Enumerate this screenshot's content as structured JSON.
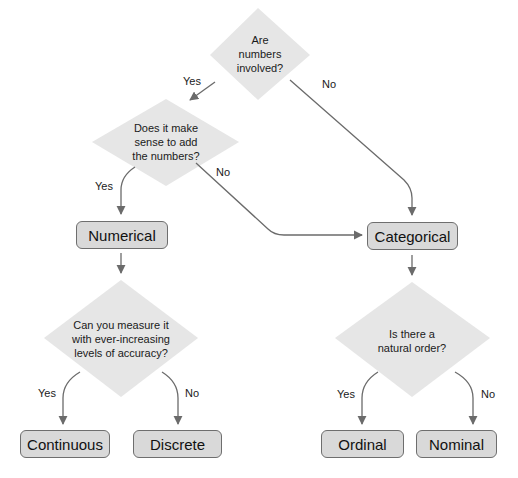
{
  "diagram": {
    "type": "decision-flowchart",
    "colors": {
      "diamond_fill": "#e6e6e6",
      "box_fill": "#d9d9d9",
      "box_border": "#6e6e6e",
      "connector": "#6b6b6b",
      "text": "#1a1a1a"
    },
    "decisions": [
      {
        "id": "d1",
        "lines": [
          "Are",
          "numbers",
          "involved?"
        ]
      },
      {
        "id": "d2",
        "lines": [
          "Does it make",
          "sense to add",
          "the numbers?"
        ]
      },
      {
        "id": "d3",
        "lines": [
          "Can you measure it",
          "with ever-increasing",
          "levels of accuracy?"
        ]
      },
      {
        "id": "d4",
        "lines": [
          "Is there a",
          "natural order?"
        ]
      }
    ],
    "outcomes": [
      {
        "id": "numerical",
        "label": "Numerical"
      },
      {
        "id": "categorical",
        "label": "Categorical"
      },
      {
        "id": "continuous",
        "label": "Continuous"
      },
      {
        "id": "discrete",
        "label": "Discrete"
      },
      {
        "id": "ordinal",
        "label": "Ordinal"
      },
      {
        "id": "nominal",
        "label": "Nominal"
      }
    ],
    "edges": [
      {
        "from": "d1",
        "to": "d2",
        "label": "Yes"
      },
      {
        "from": "d1",
        "to": "categorical",
        "label": "No"
      },
      {
        "from": "d2",
        "to": "numerical",
        "label": "Yes"
      },
      {
        "from": "d2",
        "to": "categorical",
        "label": "No"
      },
      {
        "from": "numerical",
        "to": "d3",
        "label": ""
      },
      {
        "from": "categorical",
        "to": "d4",
        "label": ""
      },
      {
        "from": "d3",
        "to": "continuous",
        "label": "Yes"
      },
      {
        "from": "d3",
        "to": "discrete",
        "label": "No"
      },
      {
        "from": "d4",
        "to": "ordinal",
        "label": "Yes"
      },
      {
        "from": "d4",
        "to": "nominal",
        "label": "No"
      }
    ]
  }
}
